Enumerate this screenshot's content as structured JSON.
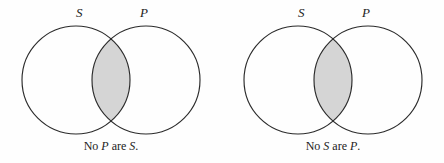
{
  "figure": {
    "type": "venn-diagram-pair",
    "background_color": "#fefefe",
    "stroke_color": "#2b2b2b",
    "shade_color": "#d5d5d5",
    "diagrams": [
      {
        "id": "left",
        "set_label_left": "S",
        "set_label_right": "P",
        "shaded_region": "intersection",
        "caption": {
          "full_text": "No P are S.",
          "part1": "No",
          "var1": "P",
          "part2": "are",
          "var2": "S",
          "part3": "."
        }
      },
      {
        "id": "right",
        "set_label_left": "S",
        "set_label_right": "P",
        "shaded_region": "intersection",
        "caption": {
          "full_text": "No S are P.",
          "part1": "No",
          "var1": "S",
          "part2": "are",
          "var2": "P",
          "part3": "."
        }
      }
    ]
  }
}
